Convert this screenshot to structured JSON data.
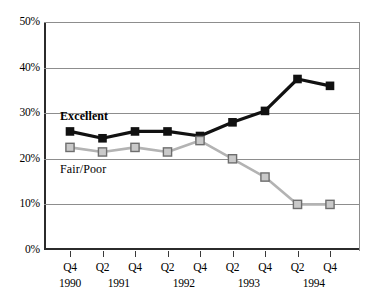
{
  "chart_data": {
    "type": "line",
    "title": "",
    "xlabel": "",
    "ylabel": "",
    "ylim": [
      0,
      50
    ],
    "grid": true,
    "legend_position": "inline-annotation",
    "categories": [
      "Q4 1990",
      "Q2 1991",
      "Q4 1991",
      "Q2 1992",
      "Q4 1992",
      "Q2 1993",
      "Q4 1993",
      "Q2 1994",
      "Q4 1994"
    ],
    "x_quarter_labels": [
      "Q4",
      "Q2",
      "Q4",
      "Q2",
      "Q4",
      "Q2",
      "Q4",
      "Q2",
      "Q4"
    ],
    "x_year_labels": [
      "1990",
      "1991",
      "1992",
      "1993",
      "1994"
    ],
    "y_tick_labels": [
      "50%",
      "40%",
      "30%",
      "20%",
      "10%",
      "0%"
    ],
    "y_tick_values": [
      50,
      40,
      30,
      20,
      10,
      0
    ],
    "series": [
      {
        "name": "Excellent",
        "color": "#111111",
        "marker": "filled-square",
        "values": [
          26,
          24.5,
          26,
          26,
          25,
          28,
          30.5,
          37.5,
          36
        ]
      },
      {
        "name": "Fair/Poor",
        "color": "#b3b3b3",
        "marker": "open-square",
        "values": [
          22.5,
          21.5,
          22.5,
          21.5,
          24,
          20,
          16,
          10,
          10
        ]
      }
    ],
    "annotations": [
      {
        "text": "Excellent",
        "bold": true
      },
      {
        "text": "Fair/Poor",
        "bold": false
      }
    ]
  }
}
